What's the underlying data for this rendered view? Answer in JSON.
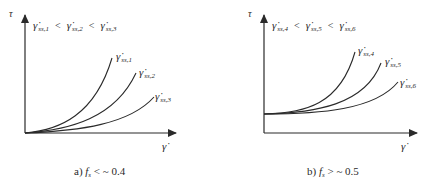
{
  "panels": [
    {
      "id": "a",
      "y_axis_label": "τ",
      "x_axis_label": "γ̇",
      "ordering": {
        "terms": [
          "γ̇",
          "γ̇",
          "γ̇"
        ],
        "subs": [
          "ss,1",
          "ss,2",
          "ss,3"
        ],
        "operator": "<"
      },
      "curves": [
        {
          "label": "γ̇",
          "sub": "ss,1"
        },
        {
          "label": "γ̇",
          "sub": "ss,2"
        },
        {
          "label": "γ̇",
          "sub": "ss,3"
        }
      ],
      "caption": {
        "prefix": "a)",
        "var": "f",
        "var_sub": "s",
        "relation": "< ~ 0.4"
      },
      "intercept": "zero"
    },
    {
      "id": "b",
      "y_axis_label": "τ",
      "x_axis_label": "γ̇",
      "ordering": {
        "terms": [
          "γ̇",
          "γ̇",
          "γ̇"
        ],
        "subs": [
          "ss,4",
          "ss,5",
          "ss,6"
        ],
        "operator": "<"
      },
      "curves": [
        {
          "label": "γ̇",
          "sub": "ss,4"
        },
        {
          "label": "γ̇",
          "sub": "ss,5"
        },
        {
          "label": "γ̇",
          "sub": "ss,6"
        }
      ],
      "caption": {
        "prefix": "b)",
        "var": "f",
        "var_sub": "s",
        "relation": "> ~ 0.5"
      },
      "intercept": "nonzero"
    }
  ],
  "colors": {
    "ink": "#2a2a2a",
    "background": "#ffffff"
  }
}
